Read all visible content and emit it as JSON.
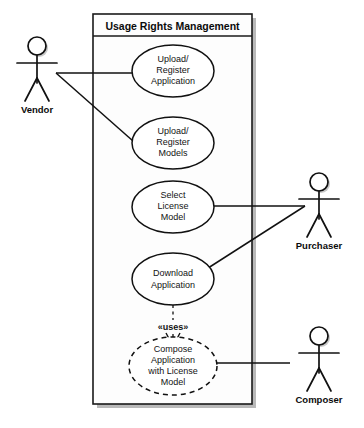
{
  "diagram": {
    "kind": "uml-use-case-diagram",
    "system_boundary": {
      "title": "Usage Rights Management"
    },
    "use_cases": [
      {
        "id": "upload-register-application",
        "lines": [
          "Upload/",
          "Register",
          "Application"
        ],
        "style": "solid"
      },
      {
        "id": "upload-register-models",
        "lines": [
          "Upload/",
          "Register",
          "Models"
        ],
        "style": "solid"
      },
      {
        "id": "select-license-model",
        "lines": [
          "Select",
          "License",
          "Model"
        ],
        "style": "solid"
      },
      {
        "id": "download-application",
        "lines": [
          "Download",
          "Application"
        ],
        "style": "solid"
      },
      {
        "id": "compose-application-with-license-model",
        "lines": [
          "Compose",
          "Application",
          "with License",
          "Model"
        ],
        "style": "dashed"
      }
    ],
    "actors": [
      {
        "id": "vendor",
        "label": "Vendor"
      },
      {
        "id": "purchaser",
        "label": "Purchaser"
      },
      {
        "id": "composer",
        "label": "Composer"
      }
    ],
    "relationships": [
      {
        "from": "vendor",
        "to": "upload-register-application",
        "type": "association"
      },
      {
        "from": "vendor",
        "to": "upload-register-models",
        "type": "association"
      },
      {
        "from": "purchaser",
        "to": "select-license-model",
        "type": "association"
      },
      {
        "from": "purchaser",
        "to": "download-application",
        "type": "association"
      },
      {
        "from": "composer",
        "to": "compose-application-with-license-model",
        "type": "association"
      },
      {
        "from": "download-application",
        "to": "compose-application-with-license-model",
        "type": "dependency",
        "stereotype": "«uses»"
      }
    ],
    "stereotype_labels": {
      "uses": "«uses»"
    },
    "colors": {
      "stroke": "#111111",
      "fill": "#ffffff",
      "boundary_fill": "#fdfdfd",
      "shadow": "#b9b9b9",
      "background": "#ffffff"
    }
  }
}
